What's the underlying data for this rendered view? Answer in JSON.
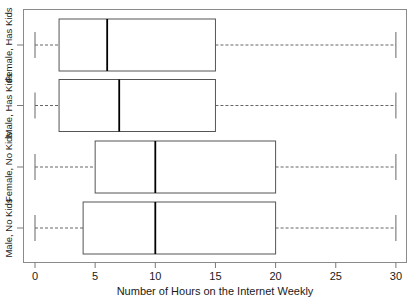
{
  "chart_data": {
    "type": "boxplot",
    "title": "",
    "xlabel": "Number of Hours on the Internet Weekly",
    "ylabel": "",
    "orientation": "horizontal",
    "xlim": [
      0,
      31
    ],
    "grid": false,
    "legend": "none",
    "xticks": [
      {
        "value": 0,
        "label": "0"
      },
      {
        "value": 5,
        "label": "5"
      },
      {
        "value": 10,
        "label": "10"
      },
      {
        "value": 15,
        "label": "15"
      },
      {
        "value": 20,
        "label": "20"
      },
      {
        "value": 25,
        "label": "25"
      },
      {
        "value": 30,
        "label": "30"
      }
    ],
    "categories": [
      "Female, Has Kids",
      "Male, Has Kids",
      "Female, No Kids",
      "Male, No Kids"
    ],
    "boxes": [
      {
        "category": "Female, Has Kids",
        "whisker_low": 0,
        "q1": 2,
        "median": 6,
        "q3": 15,
        "whisker_high": 30
      },
      {
        "category": "Male, Has Kids",
        "whisker_low": 0,
        "q1": 2,
        "median": 7,
        "q3": 15,
        "whisker_high": 30
      },
      {
        "category": "Female, No Kids",
        "whisker_low": 0,
        "q1": 5,
        "median": 10,
        "q3": 20,
        "whisker_high": 30
      },
      {
        "category": "Male, No Kids",
        "whisker_low": 0,
        "q1": 4,
        "median": 10,
        "q3": 20,
        "whisker_high": 30
      }
    ],
    "colors": {
      "box_stroke": "#555555",
      "median_stroke": "#000000",
      "whisker_stroke": "#666666",
      "frame_stroke": "#888888",
      "background": "#ffffff"
    }
  }
}
